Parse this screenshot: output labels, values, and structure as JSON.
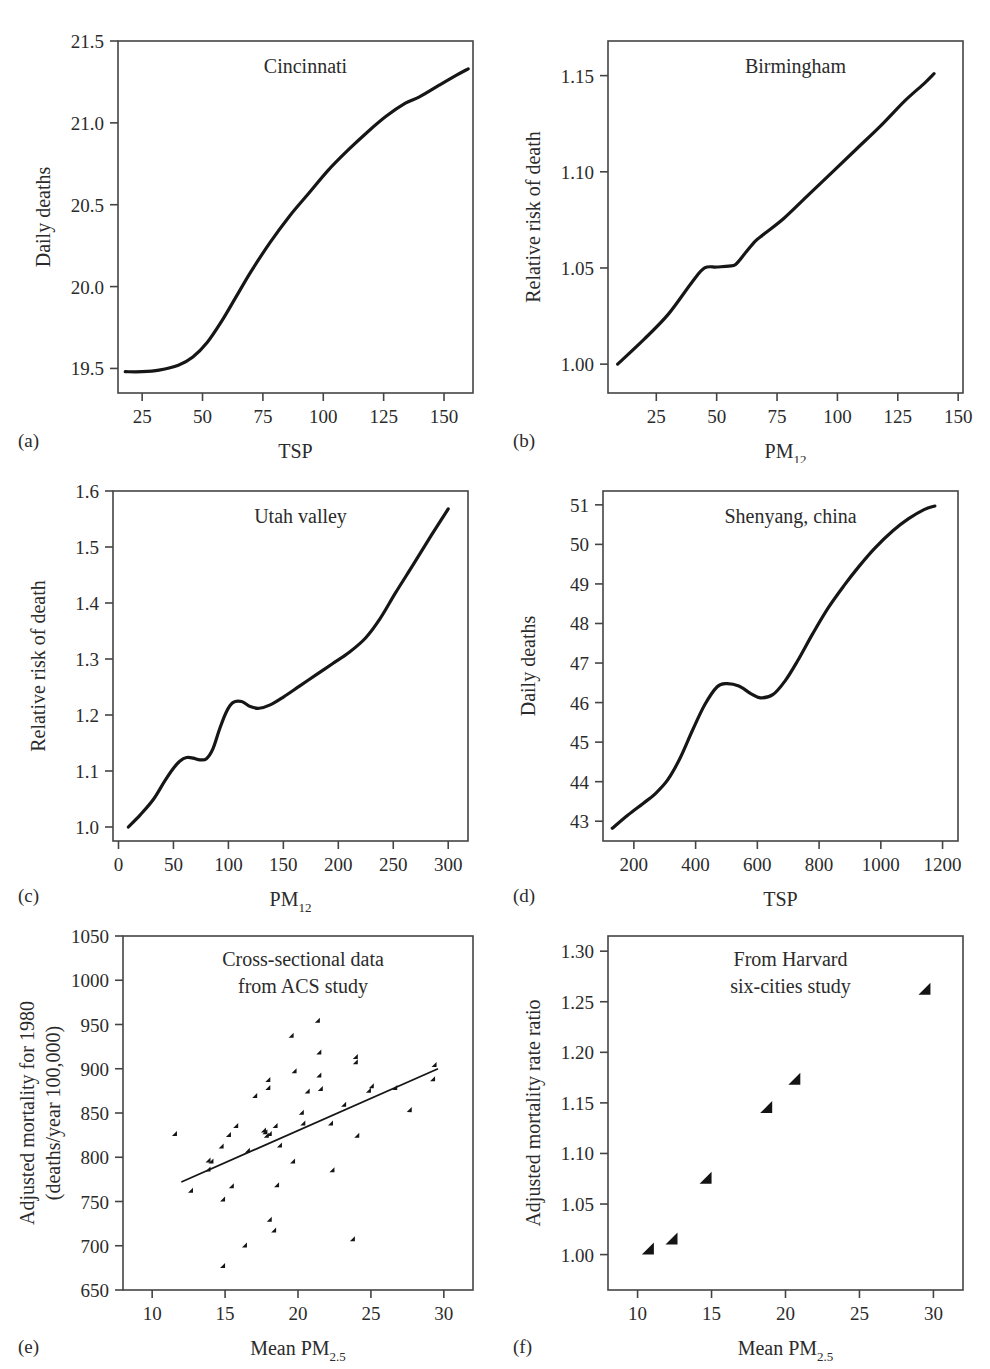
{
  "figure": {
    "panel_labels": [
      "(a)",
      "(b)",
      "(c)",
      "(d)",
      "(e)",
      "(f)"
    ]
  },
  "chart_data": [
    {
      "id": "a",
      "panel_label": "(a)",
      "type": "line",
      "title": "Cincinnati",
      "xlabel": "TSP",
      "ylabel": "Daily deaths",
      "xlim": [
        15,
        162
      ],
      "ylim": [
        19.35,
        21.5
      ],
      "xticks": [
        25,
        50,
        75,
        100,
        125,
        150
      ],
      "xticklabels": [
        "25",
        "50",
        "75",
        "100",
        "125",
        "150"
      ],
      "yticks": [
        19.5,
        20.0,
        20.5,
        21.0,
        21.5
      ],
      "yticklabels": [
        "19.5",
        "20.0",
        "20.5",
        "21.0",
        "21.5"
      ],
      "grid": false,
      "legend": "none",
      "x": [
        18,
        25,
        32,
        40,
        46,
        52,
        58,
        64,
        70,
        78,
        86,
        94,
        102,
        110,
        118,
        126,
        134,
        140,
        148,
        155,
        160
      ],
      "y": [
        19.48,
        19.48,
        19.49,
        19.52,
        19.57,
        19.66,
        19.79,
        19.94,
        20.09,
        20.27,
        20.43,
        20.57,
        20.71,
        20.83,
        20.94,
        21.04,
        21.12,
        21.16,
        21.23,
        21.29,
        21.33
      ]
    },
    {
      "id": "b",
      "panel_label": "(b)",
      "type": "line",
      "title": "Birmingham",
      "xlabel": "PM12",
      "xlabel_base": "PM",
      "xlabel_sub": "12",
      "ylabel": "Relative risk of death",
      "xlim": [
        5,
        152
      ],
      "ylim": [
        0.985,
        1.168
      ],
      "xticks": [
        25,
        50,
        75,
        100,
        125,
        150
      ],
      "xticklabels": [
        "25",
        "50",
        "75",
        "100",
        "125",
        "150"
      ],
      "yticks": [
        1.0,
        1.05,
        1.1,
        1.15
      ],
      "yticklabels": [
        "1.00",
        "1.05",
        "1.10",
        "1.15"
      ],
      "grid": false,
      "legend": "none",
      "x": [
        9,
        20,
        30,
        40,
        45,
        50,
        55,
        58,
        62,
        66,
        70,
        78,
        88,
        98,
        108,
        118,
        128,
        136,
        140
      ],
      "y": [
        1.0,
        1.013,
        1.026,
        1.043,
        1.05,
        1.0505,
        1.051,
        1.052,
        1.058,
        1.064,
        1.068,
        1.076,
        1.088,
        1.1,
        1.112,
        1.124,
        1.137,
        1.146,
        1.151
      ]
    },
    {
      "id": "c",
      "panel_label": "(c)",
      "type": "line",
      "title": "Utah valley",
      "xlabel": "PM12",
      "xlabel_base": "PM",
      "xlabel_sub": "12",
      "ylabel": "Relative risk of death",
      "xlim": [
        -5,
        318
      ],
      "ylim": [
        0.975,
        1.6
      ],
      "xticks": [
        0,
        50,
        100,
        150,
        200,
        250,
        300
      ],
      "xticklabels": [
        "0",
        "50",
        "100",
        "150",
        "200",
        "250",
        "300"
      ],
      "yticks": [
        1.0,
        1.1,
        1.2,
        1.3,
        1.4,
        1.5,
        1.6
      ],
      "yticklabels": [
        "1.0",
        "1.1",
        "1.2",
        "1.3",
        "1.4",
        "1.5",
        "1.6"
      ],
      "grid": false,
      "legend": "none",
      "x": [
        9,
        20,
        32,
        42,
        50,
        56,
        62,
        68,
        74,
        80,
        86,
        92,
        98,
        104,
        112,
        120,
        128,
        138,
        150,
        165,
        180,
        195,
        210,
        225,
        238,
        252,
        268,
        285,
        300
      ],
      "y": [
        1.0,
        1.022,
        1.05,
        1.082,
        1.105,
        1.118,
        1.124,
        1.123,
        1.12,
        1.122,
        1.14,
        1.175,
        1.205,
        1.222,
        1.224,
        1.215,
        1.212,
        1.218,
        1.232,
        1.252,
        1.272,
        1.292,
        1.312,
        1.338,
        1.372,
        1.418,
        1.468,
        1.522,
        1.568
      ]
    },
    {
      "id": "d",
      "panel_label": "(d)",
      "type": "line",
      "title": "Shenyang, china",
      "xlabel": "TSP",
      "ylabel": "Daily deaths",
      "xlim": [
        100,
        1250
      ],
      "ylim": [
        42.5,
        51.35
      ],
      "xticks": [
        200,
        400,
        600,
        800,
        1000,
        1200
      ],
      "xticklabels": [
        "200",
        "400",
        "600",
        "800",
        "1000",
        "1200"
      ],
      "yticks": [
        43,
        44,
        45,
        46,
        47,
        48,
        49,
        50,
        51
      ],
      "yticklabels": [
        "43",
        "44",
        "45",
        "46",
        "47",
        "48",
        "49",
        "50",
        "51"
      ],
      "grid": false,
      "legend": "none",
      "x": [
        130,
        180,
        230,
        270,
        310,
        350,
        390,
        430,
        470,
        500,
        540,
        580,
        610,
        650,
        690,
        730,
        780,
        830,
        880,
        930,
        980,
        1040,
        1090,
        1140,
        1175
      ],
      "y": [
        42.82,
        43.15,
        43.45,
        43.7,
        44.05,
        44.6,
        45.3,
        45.95,
        46.4,
        46.48,
        46.42,
        46.22,
        46.12,
        46.2,
        46.55,
        47.05,
        47.75,
        48.4,
        48.95,
        49.45,
        49.9,
        50.35,
        50.65,
        50.88,
        50.97
      ]
    },
    {
      "id": "e",
      "panel_label": "(e)",
      "type": "scatter",
      "title_lines": [
        "Cross-sectional data",
        "from ACS study"
      ],
      "xlabel": "Mean PM2.5",
      "xlabel_base": "Mean PM",
      "xlabel_sub": "2.5",
      "ylabel_lines": [
        "Adjusted mortality for 1980",
        "(deaths/year 100,000)"
      ],
      "xlim": [
        8,
        32
      ],
      "ylim": [
        650,
        1050
      ],
      "xticks": [
        10,
        15,
        20,
        25,
        30
      ],
      "xticklabels": [
        "10",
        "15",
        "20",
        "25",
        "30"
      ],
      "yticks": [
        650,
        700,
        750,
        800,
        850,
        900,
        950,
        1000,
        1050
      ],
      "yticklabels": [
        "650",
        "700",
        "750",
        "800",
        "850",
        "900",
        "950",
        "1000",
        "1050"
      ],
      "grid": false,
      "legend": "none",
      "points": [
        [
          11.7,
          824
        ],
        [
          12.8,
          760
        ],
        [
          14.0,
          794
        ],
        [
          14.0,
          784
        ],
        [
          14.2,
          793
        ],
        [
          14.9,
          810
        ],
        [
          15.0,
          750
        ],
        [
          15.0,
          675
        ],
        [
          15.4,
          823
        ],
        [
          15.6,
          765
        ],
        [
          15.9,
          833
        ],
        [
          16.5,
          698
        ],
        [
          16.7,
          805
        ],
        [
          17.2,
          867
        ],
        [
          17.8,
          828
        ],
        [
          17.9,
          826
        ],
        [
          18.0,
          822
        ],
        [
          18.1,
          885
        ],
        [
          18.1,
          876
        ],
        [
          18.2,
          727
        ],
        [
          18.2,
          824
        ],
        [
          18.5,
          715
        ],
        [
          18.6,
          833
        ],
        [
          18.7,
          766
        ],
        [
          18.9,
          811
        ],
        [
          19.7,
          935
        ],
        [
          19.8,
          793
        ],
        [
          19.9,
          895
        ],
        [
          20.4,
          848
        ],
        [
          20.5,
          836
        ],
        [
          20.8,
          872
        ],
        [
          21.5,
          952
        ],
        [
          21.6,
          916
        ],
        [
          21.6,
          890
        ],
        [
          21.7,
          875
        ],
        [
          22.4,
          836
        ],
        [
          22.5,
          783
        ],
        [
          23.3,
          857
        ],
        [
          23.9,
          705
        ],
        [
          24.1,
          911
        ],
        [
          24.1,
          905
        ],
        [
          24.2,
          822
        ],
        [
          25.0,
          873
        ],
        [
          25.2,
          878
        ],
        [
          26.8,
          876
        ],
        [
          27.8,
          851
        ],
        [
          29.4,
          886
        ],
        [
          29.5,
          902
        ]
      ],
      "fit_line": {
        "x0": 12.0,
        "y0": 772,
        "x1": 29.6,
        "y1": 900
      }
    },
    {
      "id": "f",
      "panel_label": "(f)",
      "type": "scatter",
      "title_lines": [
        "From Harvard",
        "six-cities study"
      ],
      "xlabel": "Mean PM2.5",
      "xlabel_base": "Mean PM",
      "xlabel_sub": "2.5",
      "ylabel": "Adjusted mortality rate ratio",
      "xlim": [
        8,
        32
      ],
      "ylim": [
        0.965,
        1.315
      ],
      "xticks": [
        10,
        15,
        20,
        25,
        30
      ],
      "xticklabels": [
        "10",
        "15",
        "20",
        "25",
        "30"
      ],
      "yticks": [
        1.0,
        1.05,
        1.1,
        1.15,
        1.2,
        1.25,
        1.3
      ],
      "yticklabels": [
        "1.00",
        "1.05",
        "1.10",
        "1.15",
        "1.20",
        "1.25",
        "1.30"
      ],
      "grid": false,
      "legend": "none",
      "points": [
        [
          11.1,
          1.0
        ],
        [
          12.7,
          1.01
        ],
        [
          15.0,
          1.07
        ],
        [
          19.1,
          1.14
        ],
        [
          21.0,
          1.168
        ],
        [
          29.8,
          1.257
        ]
      ]
    }
  ]
}
